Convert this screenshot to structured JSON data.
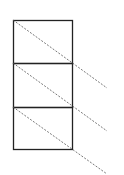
{
  "diagram": {
    "stroke_color": "#222222",
    "dash_color": "#555555",
    "background": "#ffffff",
    "boxes": [
      {
        "x": 13,
        "y": 20,
        "w": 59,
        "h": 43
      },
      {
        "x": 13,
        "y": 63,
        "w": 59,
        "h": 44
      },
      {
        "x": 13,
        "y": 107,
        "w": 59,
        "h": 42
      }
    ],
    "dashed_lines": [
      {
        "x1": 13,
        "y1": 20,
        "x2": 107,
        "y2": 88
      },
      {
        "x1": 13,
        "y1": 63,
        "x2": 107,
        "y2": 131
      },
      {
        "x1": 13,
        "y1": 107,
        "x2": 107,
        "y2": 174
      }
    ]
  }
}
